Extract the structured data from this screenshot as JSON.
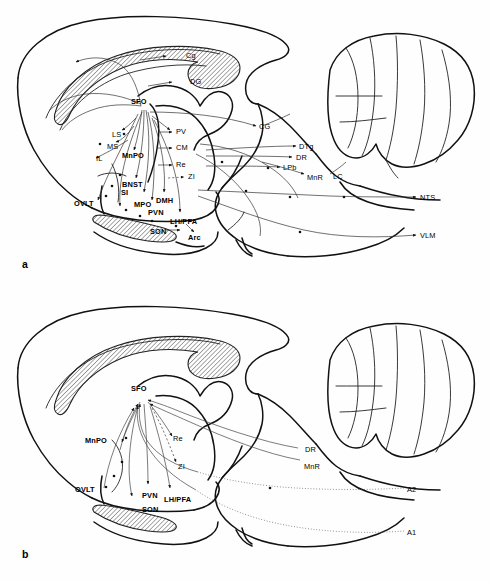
{
  "figure": {
    "background": "#ffffff",
    "ink": "#111111",
    "type": "sagittal-rat-brain-connectivity-diagram",
    "panels": [
      {
        "id": "a",
        "letter": "a",
        "letter_pos": [
          22,
          262
        ],
        "labels": [
          {
            "text": "Cg",
            "x": 186,
            "y": 52,
            "bold": false
          },
          {
            "text": "DG",
            "x": 190,
            "y": 78,
            "bold": false
          },
          {
            "text": "SFO",
            "x": 131,
            "y": 98,
            "bold": true
          },
          {
            "text": "LS",
            "x": 112,
            "y": 131,
            "bold": false
          },
          {
            "text": "MS",
            "x": 107,
            "y": 143,
            "bold": false
          },
          {
            "text": "IL",
            "x": 96,
            "y": 155,
            "bold": false
          },
          {
            "text": "MnPO",
            "x": 122,
            "y": 152,
            "bold": true
          },
          {
            "text": "PV",
            "x": 176,
            "y": 132,
            "bold": false
          },
          {
            "text": "CM",
            "x": 176,
            "y": 148,
            "bold": false
          },
          {
            "text": "Re",
            "x": 176,
            "y": 165,
            "bold": false
          },
          {
            "text": "ZI",
            "x": 188,
            "y": 176,
            "bold": false
          },
          {
            "text": "BNST",
            "x": 122,
            "y": 184,
            "bold": true
          },
          {
            "text": "SI",
            "x": 121,
            "y": 192,
            "bold": true
          },
          {
            "text": "OVLT",
            "x": 76,
            "y": 201,
            "bold": true
          },
          {
            "text": "MPO",
            "x": 134,
            "y": 202,
            "bold": true
          },
          {
            "text": "DMH",
            "x": 156,
            "y": 198,
            "bold": true
          },
          {
            "text": "PVN",
            "x": 148,
            "y": 210,
            "bold": true
          },
          {
            "text": "LH/PFA",
            "x": 170,
            "y": 219,
            "bold": true
          },
          {
            "text": "SON",
            "x": 150,
            "y": 229,
            "bold": true
          },
          {
            "text": "Arc",
            "x": 188,
            "y": 235,
            "bold": true
          },
          {
            "text": "CG",
            "x": 259,
            "y": 124,
            "bold": false
          },
          {
            "text": "DTg",
            "x": 299,
            "y": 145,
            "bold": false
          },
          {
            "text": "DR",
            "x": 296,
            "y": 157,
            "bold": false
          },
          {
            "text": "LPb",
            "x": 283,
            "y": 167,
            "bold": false
          },
          {
            "text": "MnR",
            "x": 307,
            "y": 176,
            "bold": false
          },
          {
            "text": "LC",
            "x": 333,
            "y": 176,
            "bold": false
          },
          {
            "text": "NTS",
            "x": 420,
            "y": 196,
            "bold": false
          },
          {
            "text": "VLM",
            "x": 420,
            "y": 234,
            "bold": false
          }
        ]
      },
      {
        "id": "b",
        "letter": "b",
        "letter_pos": [
          22,
          552
        ],
        "labels": [
          {
            "text": "SFO",
            "x": 131,
            "y": 96,
            "bold": true
          },
          {
            "text": "MnPO",
            "x": 88,
            "y": 148,
            "bold": true
          },
          {
            "text": "Re",
            "x": 173,
            "y": 148,
            "bold": false
          },
          {
            "text": "ZI",
            "x": 178,
            "y": 176,
            "bold": false
          },
          {
            "text": "DR",
            "x": 305,
            "y": 159,
            "bold": false
          },
          {
            "text": "MnR",
            "x": 306,
            "y": 176,
            "bold": false
          },
          {
            "text": "OVLT",
            "x": 78,
            "y": 197,
            "bold": true
          },
          {
            "text": "PVN",
            "x": 142,
            "y": 203,
            "bold": true
          },
          {
            "text": "LH/PFA",
            "x": 164,
            "y": 207,
            "bold": true
          },
          {
            "text": "SON",
            "x": 142,
            "y": 217,
            "bold": true
          },
          {
            "text": "A2",
            "x": 407,
            "y": 199,
            "bold": false
          },
          {
            "text": "A1",
            "x": 407,
            "y": 242,
            "bold": false
          }
        ]
      }
    ],
    "abbreviations_legend": [
      "Cg - cingulate cortex",
      "DG - dentate gyrus",
      "SFO - subfornical organ",
      "LS - lateral septum",
      "MS - medial septum",
      "IL - infralimbic cortex",
      "MnPO - median preoptic nucleus",
      "PV - paraventricular thalamic nucleus",
      "CM - central medial thalamic nucleus",
      "Re - nucleus reuniens",
      "ZI - zona incerta",
      "BNST - bed nucleus of the stria terminalis",
      "SI - substantia innominata",
      "OVLT - organum vasculosum lamina terminalis",
      "MPO - medial preoptic area",
      "DMH - dorsomedial hypothalamus",
      "PVN - paraventricular nucleus",
      "LH/PFA - lateral hypothalamus / perifornical area",
      "SON - supraoptic nucleus",
      "Arc - arcuate nucleus",
      "CG - central gray",
      "DTg - dorsal tegmental nucleus",
      "DR - dorsal raphe",
      "LPb - lateral parabrachial nucleus",
      "MnR - median raphe",
      "LC - locus coeruleus",
      "NTS - nucleus tractus solitarius",
      "VLM - ventrolateral medulla",
      "A1 - A1 noradrenergic cell group",
      "A2 - A2 noradrenergic cell group"
    ]
  }
}
